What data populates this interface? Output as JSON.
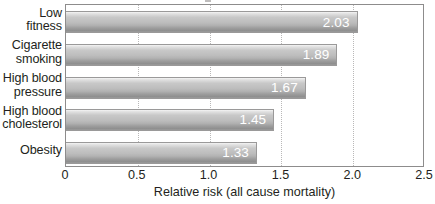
{
  "chart_data": {
    "type": "bar",
    "orientation": "horizontal",
    "title": "",
    "xlabel": "Relative risk (all cause mortality)",
    "ylabel": "",
    "categories": [
      "Low fitness",
      "Cigarette smoking",
      "High blood pressure",
      "High blood cholesterol",
      "Obesity"
    ],
    "category_lines": [
      [
        "Low",
        "fitness"
      ],
      [
        "Cigarette",
        "smoking"
      ],
      [
        "High blood",
        "pressure"
      ],
      [
        "High blood",
        "cholesterol"
      ],
      [
        "Obesity"
      ]
    ],
    "values": [
      2.03,
      1.89,
      1.67,
      1.45,
      1.33
    ],
    "value_labels": [
      "2.03",
      "1.89",
      "1.67",
      "1.45",
      "1.33"
    ],
    "xlim": [
      0,
      2.5
    ],
    "xticks": [
      0,
      0.5,
      1.0,
      1.5,
      2.0,
      2.5
    ],
    "xtick_labels": [
      "0",
      "0.5",
      "1.0",
      "1.5",
      "2.0",
      "2.5"
    ],
    "grid": "vertical-dotted",
    "legend": "none",
    "colors": {
      "bar_light": "#e2e2e2",
      "bar_mid": "#bdbdbd",
      "bar_dark": "#8f8f8f",
      "bar_border": "#9a9999",
      "value_text": "#ffffff",
      "axis_text": "#231f20",
      "frame": "#8d8c8c",
      "gridline": "#b9b8b8",
      "background": "#ffffff"
    }
  }
}
